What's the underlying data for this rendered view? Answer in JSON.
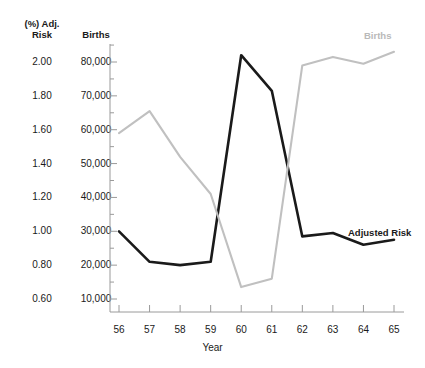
{
  "axis_headers": {
    "risk": "(%) Adj.\nRisk",
    "births": "Births"
  },
  "xlabel": "Year",
  "series_labels": {
    "births": "Births",
    "risk": "Adjusted Risk"
  },
  "colors": {
    "risk_line": "#1a1a1a",
    "births_line": "#c0c0c0",
    "axis": "#9a9a9a",
    "text": "#1a1a1a"
  },
  "risk_ticks": [
    "2.00",
    "1.80",
    "1.60",
    "1.40",
    "1.20",
    "1.00",
    "0.80",
    "0.60"
  ],
  "births_ticks": [
    "80,000",
    "70,000",
    "60,000",
    "50,000",
    "40,000",
    "30,000",
    "20,000",
    "10,000"
  ],
  "x_ticks": [
    "56",
    "57",
    "58",
    "59",
    "60",
    "61",
    "62",
    "63",
    "64",
    "65"
  ],
  "chart_data": {
    "type": "line",
    "title": "",
    "xlabel": "Year",
    "ylabel": "(%) Adj. Risk / Births",
    "x": [
      56,
      57,
      58,
      59,
      60,
      61,
      62,
      63,
      64,
      65
    ],
    "xlim": [
      55.6,
      65.4
    ],
    "grid": false,
    "legend": "inline-annotations",
    "axes": [
      {
        "name": "Adjusted Risk",
        "unit": "%",
        "ticks": [
          2.0,
          1.8,
          1.6,
          1.4,
          1.2,
          1.0,
          0.8,
          0.6
        ],
        "ylim": [
          0.6,
          2.0
        ],
        "color": "#1a1a1a"
      },
      {
        "name": "Births",
        "unit": "count",
        "ticks": [
          80000,
          70000,
          60000,
          50000,
          40000,
          30000,
          20000,
          10000
        ],
        "ylim": [
          10000,
          80000
        ],
        "color": "#c0c0c0"
      }
    ],
    "series": [
      {
        "name": "Adjusted Risk",
        "axis": "Adjusted Risk",
        "color": "#1a1a1a",
        "values": [
          1.0,
          0.82,
          0.8,
          0.82,
          2.04,
          1.83,
          0.97,
          0.99,
          0.92,
          0.95
        ]
      },
      {
        "name": "Births",
        "axis": "Births",
        "color": "#c0c0c0",
        "values": [
          59000,
          65500,
          52000,
          41000,
          13500,
          16000,
          79000,
          81500,
          79500,
          83000
        ]
      }
    ]
  }
}
